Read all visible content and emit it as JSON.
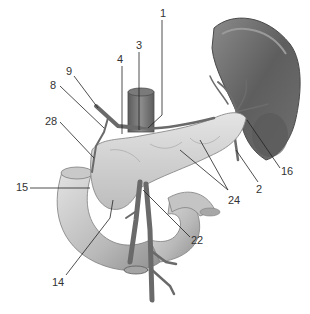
{
  "diagram": {
    "type": "anatomical-illustration",
    "colors": {
      "background": "#ffffff",
      "tissue_light": "#d6d6d6",
      "tissue_mid": "#b5b5b5",
      "tissue_dark": "#6e6e6e",
      "vessel": "#7a7a7a",
      "leader": "#222222",
      "label_text": "#333333"
    },
    "labels": [
      {
        "id": "1",
        "text": "1",
        "x": 160,
        "y": 8,
        "line": [
          162,
          20,
          162,
          115,
          148,
          128
        ]
      },
      {
        "id": "3",
        "text": "3",
        "x": 136,
        "y": 40,
        "line": [
          139,
          52,
          139,
          130
        ]
      },
      {
        "id": "4",
        "text": "4",
        "x": 117,
        "y": 54,
        "line": [
          122,
          66,
          122,
          134
        ]
      },
      {
        "id": "9",
        "text": "9",
        "x": 66,
        "y": 66,
        "line": [
          74,
          76,
          98,
          108
        ]
      },
      {
        "id": "8",
        "text": "8",
        "x": 50,
        "y": 80,
        "line": [
          60,
          86,
          104,
          128
        ]
      },
      {
        "id": "28",
        "text": "28",
        "x": 45,
        "y": 116,
        "line": [
          60,
          122,
          94,
          158
        ]
      },
      {
        "id": "15",
        "text": "15",
        "x": 16,
        "y": 182,
        "line": [
          30,
          188,
          90,
          188
        ]
      },
      {
        "id": "14",
        "text": "14",
        "x": 52,
        "y": 277,
        "line": [
          66,
          275,
          110,
          218,
          113,
          200
        ]
      },
      {
        "id": "22",
        "text": "22",
        "x": 191,
        "y": 235,
        "line": [
          190,
          237,
          143,
          190
        ]
      },
      {
        "id": "24",
        "text": "24",
        "x": 228,
        "y": 195,
        "line": [
          [
            180,
            150,
            228,
            190
          ],
          [
            200,
            140,
            228,
            190
          ]
        ]
      },
      {
        "id": "2",
        "text": "2",
        "x": 256,
        "y": 184,
        "line": [
          258,
          182,
          236,
          150
        ]
      },
      {
        "id": "16",
        "text": "16",
        "x": 281,
        "y": 166,
        "line": [
          280,
          168,
          247,
          120
        ]
      }
    ]
  }
}
